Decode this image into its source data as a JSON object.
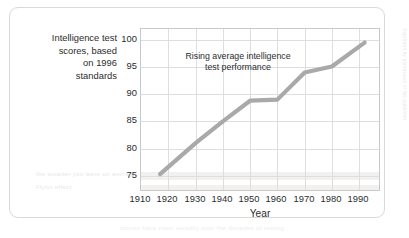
{
  "figure": {
    "y_axis_title_lines": [
      "Intelligence test",
      "scores, based",
      "on 1996",
      "standards"
    ],
    "annotation_lines": [
      "Rising average intelligence",
      "test performance"
    ],
    "line_color": "#a9a9a9",
    "grid_color": "#dedede",
    "axis_color": "#c9c9cc",
    "text_color": "#2c2c2c",
    "card_border_color": "#d9d9dc"
  },
  "artifacts": {
    "ghost_1": "the smarter you were on average",
    "ghost_2": "Flynn effect",
    "ghost_3": "scores have risen steadily over the decades of testing",
    "ghost_edge": "Reprinted by permission of the publisher"
  },
  "chart_data": {
    "type": "line",
    "title": "",
    "subtitle": "",
    "xlabel": "Year",
    "ylabel": "Intelligence test scores, based on 1996 standards",
    "xlim": [
      1910,
      1998
    ],
    "ylim": [
      72,
      102
    ],
    "xticks": [
      1910,
      1920,
      1930,
      1940,
      1950,
      1960,
      1970,
      1980,
      1990
    ],
    "xticklabels": [
      "1910",
      "1920",
      "1930",
      "1940",
      "1950",
      "1960",
      "1970",
      "1980",
      "1990"
    ],
    "yticks": [
      75,
      80,
      85,
      90,
      95,
      100
    ],
    "yticklabels": [
      "75",
      "80",
      "85",
      "90",
      "95",
      "100"
    ],
    "grid": true,
    "legend": false,
    "annotations": [
      {
        "text": "Rising average intelligence test performance",
        "x": 1935,
        "y": 97
      }
    ],
    "series": [
      {
        "name": "Average intelligence test score",
        "x": [
          1917,
          1930,
          1940,
          1950,
          1960,
          1970,
          1980,
          1992
        ],
        "values": [
          75.3,
          81.0,
          85.0,
          88.8,
          89.0,
          94.0,
          95.1,
          99.5
        ]
      }
    ]
  }
}
